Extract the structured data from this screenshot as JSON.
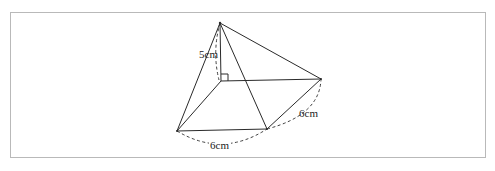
{
  "figure": {
    "type": "square pyramid",
    "labels": {
      "height": "5cm",
      "base_front_edge": "6cm",
      "base_right_edge": "6cm"
    },
    "right_angle_marker": true,
    "colors": {
      "stroke": "#2a2a2a",
      "frame": "#b9b9b9"
    }
  }
}
